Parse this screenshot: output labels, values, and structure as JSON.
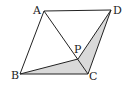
{
  "diagram": {
    "type": "geometry",
    "shape": "parallelogram",
    "points": {
      "A": {
        "label": "A",
        "x": 44,
        "y": 11
      },
      "B": {
        "label": "B",
        "x": 20,
        "y": 74
      },
      "C": {
        "label": "C",
        "x": 88,
        "y": 74
      },
      "D": {
        "label": "D",
        "x": 111,
        "y": 10
      },
      "P": {
        "label": "P",
        "x": 78,
        "y": 59
      }
    },
    "segments": [
      "AB",
      "BC",
      "CD",
      "DA",
      "AC",
      "PB",
      "PD"
    ],
    "shaded_regions": [
      "PBC",
      "PCD"
    ],
    "colors": {
      "stroke": "#222222",
      "shade": "#d9d9d9",
      "background": "#ffffff"
    }
  }
}
